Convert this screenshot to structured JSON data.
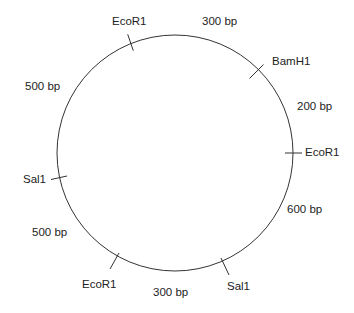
{
  "diagram": {
    "type": "plasmid-restriction-map",
    "colors": {
      "line": "#333333",
      "text": "#222222",
      "background": "#ffffff"
    },
    "sites": [
      {
        "id": "ecor1-top",
        "enzyme": "EcoR1"
      },
      {
        "id": "bamh1",
        "enzyme": "BamH1"
      },
      {
        "id": "ecor1-right",
        "enzyme": "EcoR1"
      },
      {
        "id": "sal1-bottom",
        "enzyme": "Sal1"
      },
      {
        "id": "ecor1-bottom",
        "enzyme": "EcoR1"
      },
      {
        "id": "sal1-left",
        "enzyme": "Sal1"
      }
    ],
    "fragments": [
      {
        "from": "EcoR1 (top)",
        "to": "BamH1",
        "length": "300 bp"
      },
      {
        "from": "BamH1",
        "to": "EcoR1 (right)",
        "length": "200 bp"
      },
      {
        "from": "EcoR1 (right)",
        "to": "Sal1 (bottom)",
        "length": "600 bp"
      },
      {
        "from": "Sal1 (bottom)",
        "to": "EcoR1 (bottom)",
        "length": "300 bp"
      },
      {
        "from": "EcoR1 (bottom)",
        "to": "Sal1 (left)",
        "length": "500 bp"
      },
      {
        "from": "Sal1 (left)",
        "to": "EcoR1 (top)",
        "length": "500 bp"
      }
    ]
  }
}
